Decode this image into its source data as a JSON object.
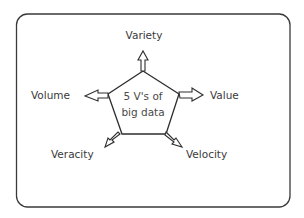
{
  "diagram": {
    "center": {
      "line1": "5 V's of",
      "line2": "big data"
    },
    "labels": {
      "top": "Variety",
      "left": "Volume",
      "right": "Value",
      "bottom_left": "Veracity",
      "bottom_right": "Velocity"
    },
    "colors": {
      "stroke": "#2e2e2e",
      "text": "#3a3a3a",
      "background": "#ffffff"
    }
  }
}
